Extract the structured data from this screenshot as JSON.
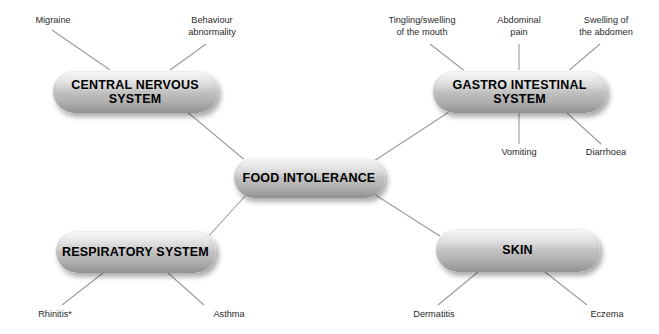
{
  "diagram": {
    "center": {
      "label": "FOOD\nINTOLERANCE"
    },
    "line_color": "#9b9b9b",
    "node_text_color": "#000000",
    "leaf_text_color": "#2b2b2b",
    "background": "#ffffff",
    "branches": [
      {
        "id": "central-nervous-system",
        "label": "CENTRAL NERVOUS\nSYSTEM",
        "leaves": [
          {
            "id": "migraine",
            "label": "Migraine"
          },
          {
            "id": "behaviour-abnormality",
            "label": "Behaviour\nabnormality"
          }
        ]
      },
      {
        "id": "gastro-intestinal-system",
        "label": "GASTRO INTESTINAL\nSYSTEM",
        "leaves": [
          {
            "id": "tingling-swelling-of-the-mouth",
            "label": "Tingling/swelling\nof the mouth"
          },
          {
            "id": "abdominal-pain",
            "label": "Abdominal\npain"
          },
          {
            "id": "swelling-of-the-abdomen",
            "label": "Swelling of\nthe abdomen"
          },
          {
            "id": "vomiting",
            "label": "Vomiting"
          },
          {
            "id": "diarrhoea",
            "label": "Diarrhoea"
          }
        ]
      },
      {
        "id": "respiratory-system",
        "label": "RESPIRATORY\nSYSTEM",
        "leaves": [
          {
            "id": "rhinitis",
            "label": "Rhinitis*"
          },
          {
            "id": "asthma",
            "label": "Asthma"
          }
        ]
      },
      {
        "id": "skin",
        "label": "SKIN",
        "leaves": [
          {
            "id": "dermatitis",
            "label": "Dermatitis"
          },
          {
            "id": "eczema",
            "label": "Eczema"
          }
        ]
      }
    ]
  }
}
